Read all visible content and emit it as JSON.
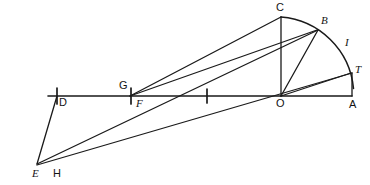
{
  "figure": {
    "type": "line-diagram",
    "width": 370,
    "height": 185,
    "background_color": "#ffffff",
    "ink_color": "#1a1a1a"
  },
  "labels": {
    "A": "A",
    "B": "B",
    "C": "C",
    "D": "D",
    "E": "E",
    "F": "F",
    "G": "G",
    "H": "H",
    "I": "I",
    "O": "O",
    "T": "T"
  },
  "geometry": {
    "points": [
      {
        "id": "A",
        "label": "A",
        "x": 352,
        "y": 96,
        "label_x": 349,
        "label_y": 99
      },
      {
        "id": "B",
        "label": "B",
        "x": 318,
        "y": 30,
        "label_x": 321,
        "label_y": 16
      },
      {
        "id": "C",
        "label": "C",
        "x": 281,
        "y": 17,
        "label_x": 277,
        "label_y": 2
      },
      {
        "id": "D",
        "label": "D",
        "x": 57,
        "y": 96,
        "label_x": 59,
        "label_y": 99
      },
      {
        "id": "E",
        "label": "E",
        "x": 36,
        "y": 165,
        "label_x": 33,
        "label_y": 169
      },
      {
        "id": "F",
        "label": "F",
        "x": 131,
        "y": 96,
        "label_x": 136,
        "label_y": 99
      },
      {
        "id": "G",
        "label": "G",
        "x": 131,
        "y": 96,
        "label_x": 120,
        "label_y": 83
      },
      {
        "id": "H",
        "label": "H",
        "x": 56,
        "y": 165,
        "label_x": 53,
        "label_y": 169
      },
      {
        "id": "I",
        "label": "I",
        "x": 345,
        "y": 47,
        "label_x": 345,
        "label_y": 38
      },
      {
        "id": "O",
        "label": "O",
        "x": 281,
        "y": 96,
        "label_x": 277,
        "label_y": 99
      },
      {
        "id": "T",
        "label": "T",
        "x": 352,
        "y": 73,
        "label_x": 355,
        "label_y": 66
      }
    ],
    "baseline": {
      "from": "D-left-extent",
      "x1": 48,
      "y1": 96,
      "x2": 352,
      "y2": 96
    },
    "arc": {
      "center_x": 281,
      "center_y": 96,
      "radius": 79,
      "start_x": 281,
      "start_y": 17,
      "end_x": 353,
      "end_y": 88,
      "description": "quarter arc from C through B and I to near T"
    },
    "segments": [
      {
        "id": "seg-O-C",
        "from": "O",
        "to": "C",
        "x1": 281,
        "y1": 96,
        "x2": 281,
        "y2": 17
      },
      {
        "id": "seg-O-B",
        "from": "O",
        "to": "B",
        "x1": 281,
        "y1": 96,
        "x2": 318,
        "y2": 30
      },
      {
        "id": "seg-O-T",
        "from": "O",
        "to": "T",
        "x1": 281,
        "y1": 96,
        "x2": 352,
        "y2": 73
      },
      {
        "id": "seg-T-A",
        "from": "T",
        "to": "A",
        "x1": 352,
        "y1": 73,
        "x2": 352,
        "y2": 96
      },
      {
        "id": "seg-F-C",
        "from": "F",
        "to": "C",
        "x1": 131,
        "y1": 96,
        "x2": 281,
        "y2": 17
      },
      {
        "id": "seg-F-B",
        "from": "F",
        "to": "B",
        "x1": 131,
        "y1": 96,
        "x2": 318,
        "y2": 30
      },
      {
        "id": "seg-E-D",
        "from": "E",
        "to": "D",
        "x1": 36,
        "y1": 165,
        "x2": 57,
        "y2": 96
      },
      {
        "id": "seg-E-F-B",
        "from": "E",
        "to": "B",
        "x1": 36,
        "y1": 165,
        "x2": 318,
        "y2": 30
      },
      {
        "id": "seg-E-T",
        "from": "E",
        "to": "T",
        "x1": 36,
        "y1": 165,
        "x2": 352,
        "y2": 73
      }
    ],
    "tick_marks": [
      {
        "id": "tick-D",
        "x": 57,
        "y": 96,
        "label": "D"
      },
      {
        "id": "tick-G",
        "x": 131,
        "y": 96,
        "label": "G"
      },
      {
        "id": "tick-mid",
        "x": 207,
        "y": 96,
        "label": ""
      }
    ]
  }
}
